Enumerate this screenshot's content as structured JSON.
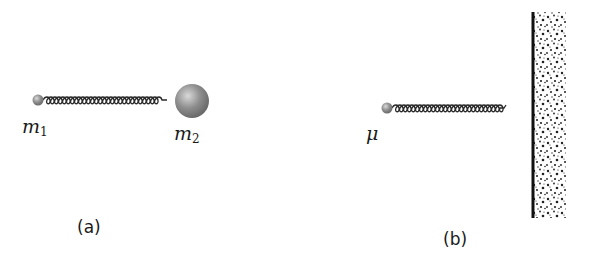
{
  "figure": {
    "panels": [
      {
        "id": "a",
        "caption": "(a)",
        "masses": [
          {
            "label_base": "m",
            "label_sub": "1",
            "size": "small"
          },
          {
            "label_base": "m",
            "label_sub": "2",
            "size": "large"
          }
        ],
        "connector": "spring"
      },
      {
        "id": "b",
        "caption": "(b)",
        "masses": [
          {
            "label_base": "μ",
            "label_sub": "",
            "size": "small"
          }
        ],
        "connector": "spring",
        "anchor": "wall"
      }
    ],
    "colors": {
      "mass": "#8a8a8a",
      "mass_highlight": "#d9d9d9",
      "spring": "#2a2a2a",
      "wall_edge": "#111111",
      "text": "#1a1a1a"
    }
  }
}
